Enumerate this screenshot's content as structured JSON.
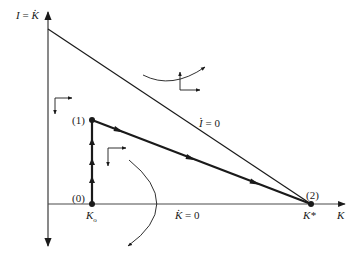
{
  "diagram": {
    "type": "phase-diagram",
    "axes": {
      "y_label_lhs": "I",
      "y_label_eq": "=",
      "y_label_rhs": "K",
      "x_label": "K"
    },
    "lines": {
      "i_dot_zero_var": "I",
      "i_dot_zero_eq": "= 0",
      "k_dot_zero_var": "K",
      "k_dot_zero_eq": "= 0"
    },
    "points": [
      {
        "id": "0",
        "label": "(0)",
        "x_label": "K",
        "x_sub": "o"
      },
      {
        "id": "1",
        "label": "(1)"
      },
      {
        "id": "2",
        "label": "(2)",
        "x_label": "K*"
      }
    ],
    "colors": {
      "ink": "#1a1a1a",
      "axis": "#4a4a4a",
      "background": "#ffffff"
    }
  }
}
